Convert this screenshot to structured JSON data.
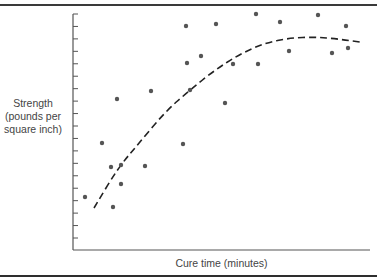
{
  "chart_data": {
    "type": "scatter",
    "title": "",
    "xlabel": "Cure time (minutes)",
    "ylabel_lines": [
      "Strength",
      "(pounds per",
      "square inch)"
    ],
    "ylabel": "Strength (pounds per square inch)",
    "x_tick_labels": [],
    "y_tick_labels": [],
    "y_tick_count": 19,
    "grid": false,
    "legend": null,
    "units_note": "No numeric axis labels shown; values are relative units measured from the axis origin (x rightward, y upward).",
    "xlim": [
      0,
      297
    ],
    "ylim": [
      0,
      236
    ],
    "series": [
      {
        "name": "observations",
        "kind": "scatter",
        "color": "#555555",
        "points": [
          {
            "x": 12,
            "y": 53
          },
          {
            "x": 29,
            "y": 107
          },
          {
            "x": 38,
            "y": 83
          },
          {
            "x": 40,
            "y": 43
          },
          {
            "x": 44,
            "y": 151
          },
          {
            "x": 48,
            "y": 85
          },
          {
            "x": 48,
            "y": 66
          },
          {
            "x": 72,
            "y": 84
          },
          {
            "x": 78,
            "y": 159
          },
          {
            "x": 110,
            "y": 106
          },
          {
            "x": 113,
            "y": 224
          },
          {
            "x": 114,
            "y": 187
          },
          {
            "x": 117,
            "y": 160
          },
          {
            "x": 128,
            "y": 194
          },
          {
            "x": 143,
            "y": 226
          },
          {
            "x": 152,
            "y": 147
          },
          {
            "x": 160,
            "y": 186
          },
          {
            "x": 183,
            "y": 236
          },
          {
            "x": 185,
            "y": 186
          },
          {
            "x": 207,
            "y": 228
          },
          {
            "x": 216,
            "y": 199
          },
          {
            "x": 245,
            "y": 235
          },
          {
            "x": 259,
            "y": 197
          },
          {
            "x": 273,
            "y": 224
          },
          {
            "x": 275,
            "y": 202
          }
        ]
      },
      {
        "name": "trend (fitted curve)",
        "kind": "line",
        "style": "dashed",
        "color": "#222222",
        "points": [
          {
            "x": 21,
            "y": 42
          },
          {
            "x": 45,
            "y": 82
          },
          {
            "x": 67,
            "y": 108
          },
          {
            "x": 92,
            "y": 138
          },
          {
            "x": 117,
            "y": 160
          },
          {
            "x": 142,
            "y": 180
          },
          {
            "x": 167,
            "y": 196
          },
          {
            "x": 192,
            "y": 207
          },
          {
            "x": 217,
            "y": 212
          },
          {
            "x": 242,
            "y": 213
          },
          {
            "x": 265,
            "y": 211
          },
          {
            "x": 287,
            "y": 208
          }
        ]
      }
    ]
  },
  "style": {
    "axis_color": "#555555",
    "point_color": "#555555",
    "curve_color": "#222222",
    "border_color": "#333333"
  }
}
